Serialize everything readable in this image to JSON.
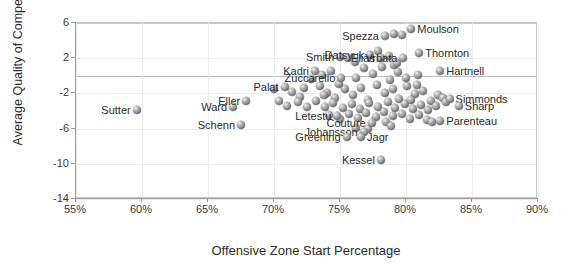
{
  "chart_data": {
    "type": "scatter",
    "title": "",
    "xlabel": "Offensive Zone Start Percentage",
    "ylabel": "Average Quality of Competition",
    "xlim": [
      55,
      90
    ],
    "ylim": [
      -14,
      6
    ],
    "xticks": [
      "55%",
      "60%",
      "65%",
      "70%",
      "75%",
      "80%",
      "85%",
      "90%"
    ],
    "xtick_values": [
      55,
      60,
      65,
      70,
      75,
      80,
      85,
      90
    ],
    "yticks": [
      "6",
      "2",
      "-2",
      "-6",
      "-10",
      "-14"
    ],
    "ytick_values": [
      6,
      2,
      -2,
      -6,
      -10,
      -14
    ],
    "grid": "horizontal-light",
    "legend": "none",
    "marker_style": "grey-3d-sphere",
    "labeled_points": [
      {
        "label": "Sutter",
        "x": 59.6,
        "y": -3.9,
        "label_side": "left"
      },
      {
        "label": "Ward",
        "x": 66.9,
        "y": -3.5,
        "label_side": "left"
      },
      {
        "label": "Eller",
        "x": 67.9,
        "y": -2.9,
        "label_side": "left"
      },
      {
        "label": "Schenn",
        "x": 67.5,
        "y": -5.6,
        "label_side": "left"
      },
      {
        "label": "Palat",
        "x": 70.8,
        "y": -1.3,
        "label_side": "left"
      },
      {
        "label": "Kadri",
        "x": 73.1,
        "y": 0.5,
        "label_side": "left"
      },
      {
        "label": "Zuccarello",
        "x": 75.1,
        "y": -0.2,
        "label_side": "left"
      },
      {
        "label": "Smith",
        "x": 75.0,
        "y": 2.1,
        "label_side": "left"
      },
      {
        "label": "Datsyuk",
        "x": 77.3,
        "y": 2.4,
        "label_side": "left"
      },
      {
        "label": "Elias",
        "x": 78.1,
        "y": 2.0,
        "label_side": "left"
      },
      {
        "label": "Spezza",
        "x": 78.4,
        "y": 4.5,
        "label_side": "left"
      },
      {
        "label": "Moulson",
        "x": 80.4,
        "y": 5.3,
        "label_side": "right"
      },
      {
        "label": "Thornton",
        "x": 81.0,
        "y": 2.6,
        "label_side": "right"
      },
      {
        "label": "Vrbata",
        "x": 79.8,
        "y": 2.0,
        "label_side": "left"
      },
      {
        "label": "Hartnell",
        "x": 82.6,
        "y": 0.5,
        "label_side": "right"
      },
      {
        "label": "Simmonds",
        "x": 83.3,
        "y": -2.6,
        "label_side": "right"
      },
      {
        "label": "Sharp",
        "x": 84.0,
        "y": -3.4,
        "label_side": "right"
      },
      {
        "label": "Parenteau",
        "x": 82.6,
        "y": -5.1,
        "label_side": "right"
      },
      {
        "label": "Letestu",
        "x": 74.8,
        "y": -4.6,
        "label_side": "left"
      },
      {
        "label": "Couture",
        "x": 77.4,
        "y": -5.4,
        "label_side": "left"
      },
      {
        "label": "Johansson",
        "x": 76.8,
        "y": -6.4,
        "label_side": "left"
      },
      {
        "label": "Greening",
        "x": 75.5,
        "y": -7.0,
        "label_side": "left"
      },
      {
        "label": "Jagr",
        "x": 76.6,
        "y": -7.0,
        "label_side": "right"
      },
      {
        "label": "Kessel",
        "x": 78.1,
        "y": -9.6,
        "label_side": "left"
      }
    ],
    "unlabeled_points": [
      {
        "x": 71.4,
        "y": -1.8
      },
      {
        "x": 72.0,
        "y": -2.4
      },
      {
        "x": 73.5,
        "y": -1.2
      },
      {
        "x": 74.0,
        "y": -1.9
      },
      {
        "x": 74.6,
        "y": -2.5
      },
      {
        "x": 75.4,
        "y": -1.5
      },
      {
        "x": 76.0,
        "y": -2.2
      },
      {
        "x": 76.6,
        "y": -1.4
      },
      {
        "x": 77.1,
        "y": -2.7
      },
      {
        "x": 77.8,
        "y": -1.1
      },
      {
        "x": 78.4,
        "y": -2.0
      },
      {
        "x": 79.0,
        "y": -1.5
      },
      {
        "x": 79.5,
        "y": -2.6
      },
      {
        "x": 80.1,
        "y": -1.2
      },
      {
        "x": 80.7,
        "y": -2.1
      },
      {
        "x": 81.3,
        "y": -1.7
      },
      {
        "x": 81.9,
        "y": -2.9
      },
      {
        "x": 82.4,
        "y": -2.2
      },
      {
        "x": 70.4,
        "y": -2.9
      },
      {
        "x": 71.0,
        "y": -3.4
      },
      {
        "x": 71.8,
        "y": -3.0
      },
      {
        "x": 72.5,
        "y": -3.6
      },
      {
        "x": 73.2,
        "y": -2.9
      },
      {
        "x": 73.9,
        "y": -3.5
      },
      {
        "x": 74.5,
        "y": -3.1
      },
      {
        "x": 75.2,
        "y": -3.7
      },
      {
        "x": 75.9,
        "y": -3.2
      },
      {
        "x": 76.5,
        "y": -3.8
      },
      {
        "x": 77.2,
        "y": -3.1
      },
      {
        "x": 77.9,
        "y": -3.6
      },
      {
        "x": 78.6,
        "y": -3.0
      },
      {
        "x": 79.2,
        "y": -3.7
      },
      {
        "x": 79.9,
        "y": -3.2
      },
      {
        "x": 80.5,
        "y": -3.8
      },
      {
        "x": 81.1,
        "y": -3.3
      },
      {
        "x": 81.7,
        "y": -3.9
      },
      {
        "x": 82.3,
        "y": -3.4
      },
      {
        "x": 74.2,
        "y": -4.4
      },
      {
        "x": 75.0,
        "y": -4.9
      },
      {
        "x": 75.7,
        "y": -4.3
      },
      {
        "x": 76.4,
        "y": -4.8
      },
      {
        "x": 77.0,
        "y": -4.2
      },
      {
        "x": 77.7,
        "y": -4.7
      },
      {
        "x": 78.3,
        "y": -4.1
      },
      {
        "x": 79.0,
        "y": -4.6
      },
      {
        "x": 79.7,
        "y": -4.3
      },
      {
        "x": 80.3,
        "y": -4.9
      },
      {
        "x": 81.0,
        "y": -4.4
      },
      {
        "x": 81.6,
        "y": -5.0
      },
      {
        "x": 72.8,
        "y": -0.4
      },
      {
        "x": 73.6,
        "y": 0.1
      },
      {
        "x": 76.2,
        "y": -0.3
      },
      {
        "x": 77.5,
        "y": 0.2
      },
      {
        "x": 78.8,
        "y": -0.5
      },
      {
        "x": 79.4,
        "y": 0.4
      },
      {
        "x": 80.0,
        "y": -0.2
      },
      {
        "x": 80.9,
        "y": 0.1
      },
      {
        "x": 76.8,
        "y": 0.9
      },
      {
        "x": 78.2,
        "y": 1.0
      },
      {
        "x": 79.1,
        "y": 1.2
      },
      {
        "x": 77.9,
        "y": 2.8
      },
      {
        "x": 78.7,
        "y": 2.3
      },
      {
        "x": 79.3,
        "y": 1.4
      },
      {
        "x": 79.7,
        "y": 4.6
      },
      {
        "x": 79.1,
        "y": 4.8
      },
      {
        "x": 75.6,
        "y": 2.0
      },
      {
        "x": 76.1,
        "y": 1.6
      },
      {
        "x": 74.3,
        "y": 0.6
      },
      {
        "x": 70.0,
        "y": -1.5
      },
      {
        "x": 82.8,
        "y": -2.5
      },
      {
        "x": 83.0,
        "y": -3.0
      },
      {
        "x": 82.0,
        "y": -5.3
      },
      {
        "x": 78.5,
        "y": -5.2
      },
      {
        "x": 78.9,
        "y": -5.7
      },
      {
        "x": 77.1,
        "y": -6.0
      },
      {
        "x": 76.2,
        "y": -5.9
      },
      {
        "x": 80.4,
        "y": -2.7
      },
      {
        "x": 80.8,
        "y": -1.0
      },
      {
        "x": 74.9,
        "y": -0.9
      },
      {
        "x": 73.8,
        "y": -2.2
      },
      {
        "x": 72.3,
        "y": -1.4
      }
    ]
  }
}
